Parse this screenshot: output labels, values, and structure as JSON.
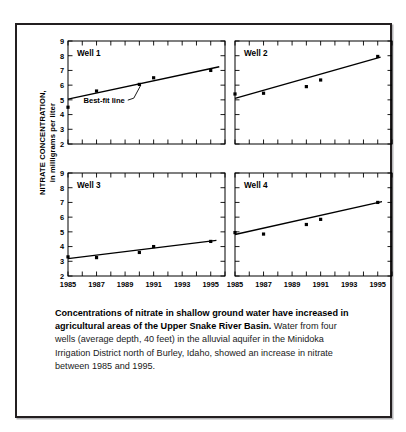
{
  "figure": {
    "ylabel_line1": "NITRATE CONCENTRATION,",
    "ylabel_line2": "in milligrams per liter",
    "annotation": "Best-fit line",
    "caption_bold": "Concentrations of nitrate in shallow ground water have increased in agricultural areas of the Upper Snake River Basin.",
    "caption_rest": " Water from four wells (average depth, 40 feet) in the alluvial aquifer in the Minidoka Irrigation District north of Burley, Idaho, showed an increase in nitrate between 1985 and 1995."
  },
  "chart_data": {
    "type": "scatter",
    "title": "",
    "xlabel": "",
    "ylabel": "NITRATE CONCENTRATION, in milligrams per liter",
    "xlim": [
      1985,
      1996
    ],
    "ylim": [
      2,
      9
    ],
    "yticks": [
      2,
      3,
      4,
      5,
      6,
      7,
      8,
      9
    ],
    "xticks": [
      1985,
      1986,
      1987,
      1988,
      1989,
      1990,
      1991,
      1992,
      1993,
      1994,
      1995,
      1996
    ],
    "xticklabels": [
      "1985",
      "1987",
      "1989",
      "1991",
      "1993",
      "1995"
    ],
    "xticklabel_values": [
      1985,
      1987,
      1989,
      1991,
      1993,
      1995
    ],
    "grid": false,
    "legend": "none",
    "annotations": [
      "Best-fit line"
    ],
    "panels": [
      {
        "name": "Well 1",
        "x": [
          1985,
          1987,
          1990,
          1991,
          1995
        ],
        "y": [
          4.5,
          5.6,
          6.05,
          6.5,
          7.0
        ],
        "fit_line": {
          "x": [
            1985,
            1995.6
          ],
          "y": [
            5.05,
            7.25
          ]
        }
      },
      {
        "name": "Well 2",
        "x": [
          1985,
          1987,
          1990,
          1991,
          1995
        ],
        "y": [
          5.4,
          5.45,
          5.9,
          6.35,
          7.95
        ],
        "fit_line": {
          "x": [
            1985,
            1995.2
          ],
          "y": [
            5.1,
            7.9
          ]
        }
      },
      {
        "name": "Well 3",
        "x": [
          1985,
          1987,
          1990,
          1991,
          1995
        ],
        "y": [
          3.3,
          3.25,
          3.6,
          4.0,
          4.35
        ],
        "fit_line": {
          "x": [
            1985,
            1995.4
          ],
          "y": [
            3.18,
            4.42
          ]
        }
      },
      {
        "name": "Well 4",
        "x": [
          1985,
          1987,
          1990,
          1991,
          1995
        ],
        "y": [
          4.95,
          4.85,
          5.5,
          5.85,
          7.0
        ],
        "fit_line": {
          "x": [
            1985,
            1995.3
          ],
          "y": [
            4.82,
            7.05
          ]
        }
      }
    ]
  }
}
